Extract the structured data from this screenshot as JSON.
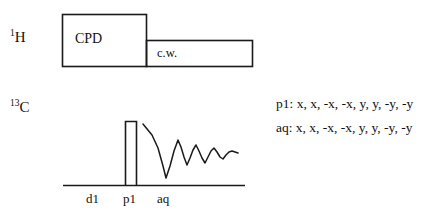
{
  "figure": {
    "kind": "nmr-pulse-sequence",
    "stroke_color": "#1a1a1a",
    "background": "#ffffff"
  },
  "channels": [
    {
      "id": "proton",
      "label_sup": "1",
      "label_main": "H",
      "blocks": [
        {
          "id": "cpd",
          "label": "CPD"
        },
        {
          "id": "cw",
          "label": "c.w."
        }
      ]
    },
    {
      "id": "carbon",
      "label_sup": "13",
      "label_main": "C",
      "pulse": {
        "id": "p1",
        "label": "p1"
      },
      "fid": {
        "id": "aq",
        "label": "aq"
      }
    }
  ],
  "timing_axis": {
    "ticks": [
      {
        "id": "d1",
        "label": "d1"
      },
      {
        "id": "p1",
        "label": "p1"
      },
      {
        "id": "aq",
        "label": "aq"
      }
    ]
  },
  "phase_cycling": {
    "lines": [
      {
        "id": "p1",
        "label": "p1: x, x, -x, -x, y, y, -y, -y"
      },
      {
        "id": "aq",
        "label": "aq: x, x, -x, -x, y, y, -y, -y"
      }
    ]
  }
}
